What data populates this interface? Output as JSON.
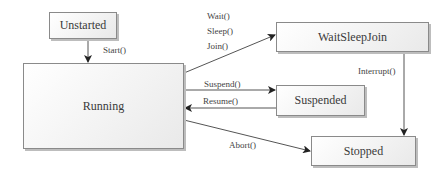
{
  "diagram": {
    "type": "state-diagram",
    "states": [
      {
        "id": "unstarted",
        "label": "Unstarted"
      },
      {
        "id": "running",
        "label": "Running"
      },
      {
        "id": "waitsleepjoin",
        "label": "WaitSleepJoin"
      },
      {
        "id": "suspended",
        "label": "Suspended"
      },
      {
        "id": "stopped",
        "label": "Stopped"
      }
    ],
    "transitions": [
      {
        "from": "unstarted",
        "to": "running",
        "label": "Start()"
      },
      {
        "from": "running",
        "to": "waitsleepjoin",
        "labels": [
          "Wait()",
          "Sleep()",
          "Join()"
        ]
      },
      {
        "from": "running",
        "to": "suspended",
        "label": "Suspend()"
      },
      {
        "from": "suspended",
        "to": "running",
        "label": "Resume()"
      },
      {
        "from": "waitsleepjoin",
        "to": "stopped",
        "label": "Interrupt()"
      },
      {
        "from": "running",
        "to": "stopped",
        "label": "Abort()"
      }
    ]
  },
  "labels": {
    "start": "Start()",
    "wait": "Wait()",
    "sleep": "Sleep()",
    "join": "Join()",
    "suspend": "Suspend()",
    "resume": "Resume()",
    "interrupt": "Interrupt()",
    "abort": "Abort()"
  },
  "colors": {
    "box_border": "#8a8a8a",
    "box_fill": "#f3f3f3",
    "line": "#555555",
    "arrowhead": "#222222"
  }
}
